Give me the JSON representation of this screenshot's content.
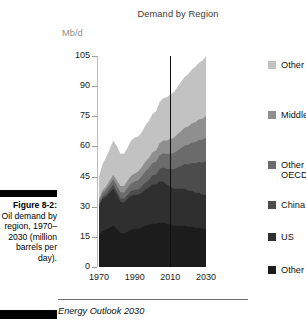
{
  "figure": {
    "label": "Figure 8-2:",
    "caption": "Oil demand by region, 1970–2030 (million barrels per day).",
    "source": "Energy Outlook 2030"
  },
  "chart_data": {
    "type": "area",
    "title": "Demand by Region",
    "subtitle": "",
    "xlabel": "",
    "ylabel": "Mb/d",
    "yunit": "Mb/d",
    "xlim": [
      1970,
      2030
    ],
    "ylim": [
      0,
      105
    ],
    "yticks": [
      0,
      15,
      30,
      45,
      60,
      75,
      90,
      105
    ],
    "xticks": [
      1970,
      1990,
      2010,
      2030
    ],
    "ytick_labels": [
      "0",
      "15",
      "30",
      "45",
      "60",
      "75",
      "90",
      "105"
    ],
    "xtick_labels": [
      "1970",
      "1990",
      "2010",
      "2030"
    ],
    "grid": false,
    "stacked": true,
    "legend_position": "right",
    "annotations": [
      {
        "type": "vline",
        "x": 2010,
        "label": "",
        "color": "#111111"
      }
    ],
    "x": [
      1970,
      1972,
      1974,
      1976,
      1978,
      1980,
      1982,
      1984,
      1986,
      1988,
      1990,
      1992,
      1994,
      1996,
      1998,
      2000,
      2002,
      2004,
      2006,
      2008,
      2010,
      2012,
      2014,
      2016,
      2018,
      2020,
      2022,
      2024,
      2026,
      2028,
      2030
    ],
    "series": [
      {
        "name": "Other OECD",
        "color": "#1c1c1c",
        "values": [
          16.0,
          18.0,
          18.5,
          19.5,
          20.5,
          19.0,
          17.0,
          16.5,
          17.5,
          18.5,
          19.0,
          19.0,
          19.5,
          20.5,
          21.0,
          21.5,
          21.5,
          22.0,
          22.0,
          21.5,
          21.0,
          20.5,
          20.5,
          20.5,
          20.5,
          20.0,
          20.0,
          19.5,
          19.5,
          19.0,
          19.0
        ]
      },
      {
        "name": "US",
        "color": "#2f2f2f",
        "values": [
          14.5,
          16.0,
          16.5,
          17.5,
          18.5,
          17.0,
          15.5,
          15.5,
          16.5,
          17.0,
          17.0,
          17.0,
          17.5,
          18.0,
          18.5,
          19.5,
          19.5,
          20.5,
          20.5,
          19.5,
          19.0,
          18.5,
          18.5,
          18.5,
          18.5,
          18.0,
          18.0,
          17.5,
          17.5,
          17.0,
          17.0
        ]
      },
      {
        "name": "China",
        "color": "#4c4c4c",
        "values": [
          0.6,
          0.9,
          1.3,
          1.7,
          1.9,
          1.8,
          1.8,
          1.8,
          2.0,
          2.3,
          2.3,
          2.6,
          3.0,
          3.5,
          3.8,
          4.6,
          5.0,
          6.3,
          7.0,
          7.8,
          8.8,
          9.6,
          10.5,
          11.3,
          12.2,
          13.0,
          13.8,
          14.6,
          15.3,
          16.0,
          16.6
        ]
      },
      {
        "name": "Other non-OECD Asia",
        "color": "#6b6b6b",
        "values": [
          1.6,
          1.9,
          2.1,
          2.4,
          2.7,
          2.8,
          3.0,
          3.2,
          3.4,
          3.8,
          4.2,
          4.6,
          5.1,
          5.6,
          5.9,
          6.2,
          6.4,
          6.8,
          7.1,
          7.4,
          7.7,
          8.1,
          8.5,
          8.9,
          9.3,
          9.7,
          10.1,
          10.5,
          10.9,
          11.3,
          11.7
        ]
      },
      {
        "name": "Middle East",
        "color": "#8f8f8f",
        "values": [
          1.2,
          1.4,
          1.7,
          2.0,
          2.3,
          2.6,
          3.0,
          3.3,
          3.5,
          3.8,
          4.0,
          4.3,
          4.5,
          4.8,
          5.1,
          5.3,
          5.6,
          6.0,
          6.4,
          6.8,
          7.2,
          7.6,
          8.0,
          8.4,
          8.8,
          9.2,
          9.5,
          9.9,
          10.2,
          10.5,
          10.8
        ]
      },
      {
        "name": "Other",
        "color": "#c2c2c2",
        "values": [
          11.0,
          13.0,
          14.5,
          15.5,
          17.0,
          17.0,
          16.0,
          16.0,
          16.5,
          17.5,
          18.0,
          17.5,
          17.5,
          18.0,
          18.5,
          19.0,
          19.5,
          20.5,
          21.0,
          21.5,
          22.0,
          22.8,
          23.6,
          24.4,
          25.2,
          26.0,
          26.8,
          27.6,
          28.3,
          29.0,
          29.9
        ]
      }
    ],
    "legend": [
      {
        "label": "Other",
        "color": "#c2c2c2"
      },
      {
        "label": "Middle East",
        "color": "#8f8f8f"
      },
      {
        "label": "Other non-\nOECD Asia",
        "color": "#6b6b6b"
      },
      {
        "label": "China",
        "color": "#4c4c4c"
      },
      {
        "label": "US",
        "color": "#2f2f2f"
      },
      {
        "label": "Other OECD",
        "color": "#1c1c1c"
      }
    ]
  }
}
